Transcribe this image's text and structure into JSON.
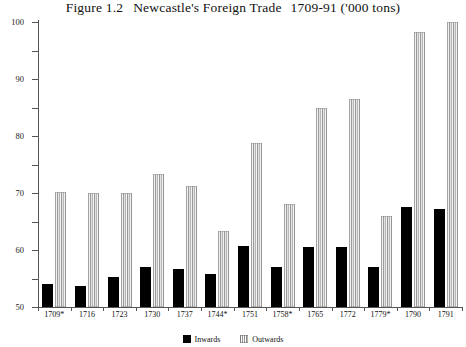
{
  "chart_data": {
    "type": "bar",
    "title_parts": {
      "figure_number": "Figure 1.2",
      "main": "Newcastle's Foreign Trade",
      "years": "1709-91 ('000 tons)"
    },
    "xlabel": "",
    "ylabel": "",
    "ylim": [
      0,
      100
    ],
    "ytick_step": 10,
    "grid": false,
    "legend_position": "bottom-center",
    "categories": [
      "1709*",
      "1716",
      "1723",
      "1730",
      "1737",
      "1744*",
      "1751",
      "1758*",
      "1765",
      "1772",
      "1779*",
      "1790",
      "1791"
    ],
    "yticks": [
      "0",
      "10",
      "20",
      "30",
      "40",
      "50",
      "60",
      "70",
      "80",
      "90",
      "100"
    ],
    "series": [
      {
        "name": "Inwards",
        "color": "#000000",
        "pattern": "solid",
        "values": [
          8,
          7.5,
          10.5,
          14,
          13.5,
          11.5,
          21.5,
          14,
          21,
          21,
          14,
          35,
          34.5
        ]
      },
      {
        "name": "Outwards",
        "color": "#b7b7b7",
        "pattern": "vertical-stripes",
        "values": [
          40.5,
          40,
          40,
          46.5,
          42.5,
          26.5,
          57.5,
          36,
          70,
          73,
          32,
          96.5,
          100
        ]
      }
    ]
  }
}
